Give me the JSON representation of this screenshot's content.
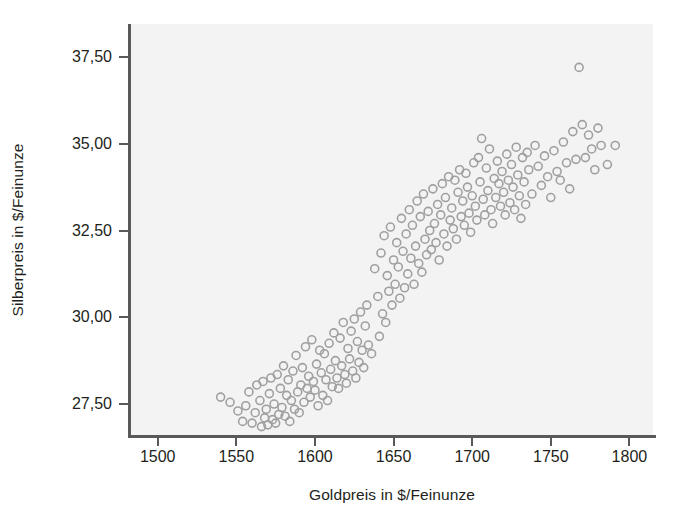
{
  "chart_data": {
    "type": "scatter",
    "title": "",
    "subtitle": "",
    "xlabel": "Goldpreis in $/Feinunze",
    "ylabel": "Silberpreis in $/Feinunze",
    "xlim": [
      1483,
      1815
    ],
    "ylim": [
      26.55,
      38.45
    ],
    "xticks": [
      1500,
      1550,
      1600,
      1650,
      1700,
      1750,
      1800
    ],
    "xticklabels": [
      "1500",
      "1550",
      "1600",
      "1650",
      "1700",
      "1750",
      "1800"
    ],
    "yticks": [
      27.5,
      30.0,
      32.5,
      35.0,
      37.5
    ],
    "yticklabels": [
      "27,50",
      "30,00",
      "32,50",
      "35,00",
      "37,50"
    ],
    "grid": false,
    "legend": false,
    "marker": {
      "shape": "open-circle",
      "color": "#a0a0a0",
      "fill": "none",
      "size": 8,
      "stroke_width": 1.6
    },
    "panel_background": "#f3f3f3",
    "figure_background": "#ffffff",
    "axis_color": "#58595b",
    "text_color": "#231f20",
    "n_points": 203,
    "series": [
      {
        "name": "Gold vs Silber",
        "x": [
          1540,
          1546,
          1551,
          1554,
          1556,
          1558,
          1560,
          1562,
          1563,
          1565,
          1566,
          1567,
          1568,
          1569,
          1570,
          1571,
          1572,
          1573,
          1574,
          1575,
          1576,
          1577,
          1578,
          1579,
          1580,
          1581,
          1582,
          1583,
          1584,
          1585,
          1586,
          1587,
          1588,
          1589,
          1590,
          1591,
          1592,
          1593,
          1594,
          1595,
          1596,
          1597,
          1598,
          1599,
          1600,
          1601,
          1602,
          1603,
          1604,
          1605,
          1606,
          1607,
          1608,
          1609,
          1610,
          1611,
          1612,
          1613,
          1614,
          1615,
          1616,
          1617,
          1618,
          1619,
          1620,
          1621,
          1622,
          1623,
          1624,
          1625,
          1626,
          1627,
          1628,
          1629,
          1630,
          1631,
          1632,
          1633,
          1634,
          1636,
          1638,
          1640,
          1641,
          1642,
          1643,
          1644,
          1645,
          1646,
          1647,
          1648,
          1649,
          1650,
          1651,
          1652,
          1653,
          1654,
          1655,
          1656,
          1657,
          1658,
          1659,
          1660,
          1661,
          1662,
          1663,
          1664,
          1665,
          1666,
          1667,
          1668,
          1669,
          1670,
          1671,
          1672,
          1673,
          1674,
          1675,
          1676,
          1677,
          1678,
          1679,
          1680,
          1681,
          1682,
          1683,
          1684,
          1685,
          1686,
          1687,
          1688,
          1689,
          1690,
          1691,
          1692,
          1693,
          1694,
          1695,
          1696,
          1697,
          1698,
          1699,
          1700,
          1701,
          1702,
          1703,
          1704,
          1705,
          1706,
          1707,
          1708,
          1709,
          1710,
          1711,
          1712,
          1713,
          1714,
          1715,
          1716,
          1717,
          1718,
          1719,
          1720,
          1721,
          1722,
          1723,
          1724,
          1725,
          1726,
          1727,
          1728,
          1729,
          1730,
          1731,
          1732,
          1733,
          1734,
          1735,
          1736,
          1738,
          1740,
          1742,
          1744,
          1746,
          1748,
          1750,
          1752,
          1754,
          1756,
          1758,
          1760,
          1762,
          1764,
          1766,
          1768,
          1770,
          1772,
          1774,
          1776,
          1778,
          1780,
          1782,
          1786,
          1791
        ],
        "y": [
          27.7,
          27.55,
          27.3,
          27.0,
          27.45,
          27.85,
          26.95,
          27.25,
          28.05,
          27.6,
          26.85,
          28.15,
          27.1,
          27.35,
          26.9,
          27.8,
          28.25,
          27.05,
          27.5,
          26.95,
          28.35,
          27.2,
          27.95,
          27.4,
          28.6,
          27.15,
          27.75,
          28.2,
          27.0,
          27.6,
          28.45,
          27.35,
          28.9,
          27.85,
          27.25,
          28.05,
          28.55,
          27.55,
          29.15,
          27.95,
          28.3,
          27.7,
          29.35,
          28.15,
          27.9,
          28.65,
          27.45,
          29.05,
          28.4,
          27.75,
          28.95,
          28.2,
          27.6,
          29.25,
          28.5,
          28.0,
          29.55,
          28.75,
          28.25,
          27.95,
          29.4,
          28.6,
          29.85,
          28.35,
          28.1,
          29.1,
          28.8,
          29.6,
          28.45,
          29.95,
          28.25,
          29.3,
          28.7,
          30.15,
          29.05,
          28.55,
          29.75,
          30.35,
          29.2,
          28.95,
          31.4,
          30.6,
          29.45,
          31.85,
          30.1,
          32.35,
          29.85,
          31.2,
          30.75,
          32.6,
          30.35,
          31.65,
          30.95,
          32.15,
          31.45,
          30.55,
          32.85,
          31.9,
          30.85,
          32.4,
          31.25,
          33.1,
          31.7,
          32.65,
          30.95,
          32.05,
          33.35,
          31.55,
          32.9,
          31.3,
          33.55,
          32.25,
          31.8,
          33.05,
          32.5,
          31.95,
          33.7,
          32.7,
          32.15,
          33.25,
          31.65,
          32.95,
          33.85,
          32.4,
          33.45,
          32.05,
          34.05,
          32.8,
          33.15,
          32.55,
          33.95,
          32.25,
          33.6,
          34.25,
          32.9,
          33.35,
          32.65,
          34.15,
          33.75,
          33.0,
          32.45,
          33.5,
          34.45,
          33.2,
          32.8,
          34.6,
          33.9,
          35.15,
          33.4,
          32.95,
          34.3,
          33.65,
          34.85,
          33.1,
          32.7,
          34.0,
          33.45,
          34.5,
          33.85,
          33.2,
          34.2,
          33.6,
          32.95,
          34.7,
          33.95,
          33.3,
          34.4,
          33.75,
          33.1,
          34.9,
          34.1,
          33.5,
          32.85,
          34.6,
          33.9,
          33.25,
          34.75,
          34.25,
          33.55,
          34.95,
          34.35,
          33.8,
          34.65,
          34.05,
          33.45,
          34.8,
          34.2,
          33.95,
          35.05,
          34.45,
          33.7,
          35.35,
          34.55,
          37.2,
          35.55,
          34.6,
          35.25,
          34.85,
          34.25,
          35.45,
          34.95,
          34.4,
          34.95
        ]
      }
    ]
  }
}
